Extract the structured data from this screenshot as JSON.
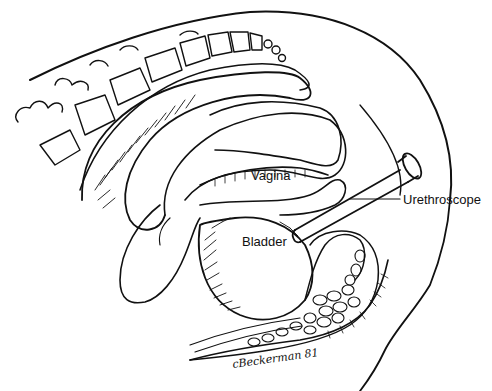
{
  "figure": {
    "type": "anatomical-line-illustration"
  },
  "labels": {
    "vagina": "Vagina",
    "bladder": "Bladder",
    "urethroscope": "Urethroscope"
  },
  "signature": "cBeckerman 81",
  "colors": {
    "ink": "#111111",
    "background": "#ffffff"
  }
}
